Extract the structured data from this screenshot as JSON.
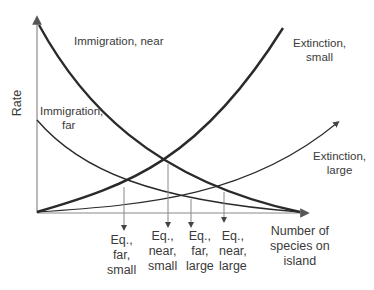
{
  "diagram": {
    "type": "island biogeography equilibrium model",
    "axes": {
      "y_label": "Rate",
      "x_label": "Number of species on island"
    },
    "curves": [
      {
        "name": "Immigration, near",
        "line1": "Immigration, near",
        "style": "thick"
      },
      {
        "name": "Immigration, far",
        "line1": "Immigration,",
        "line2": "far",
        "style": "thin"
      },
      {
        "name": "Extinction, small",
        "line1": "Extinction,",
        "line2": "small",
        "style": "thick"
      },
      {
        "name": "Extinction, large",
        "line1": "Extinction,",
        "line2": "large",
        "style": "thin"
      }
    ],
    "equilibria": [
      {
        "line1": "Eq.,",
        "line2": "far,",
        "line3": "small"
      },
      {
        "line1": "Eq.,",
        "line2": "near,",
        "line3": "small"
      },
      {
        "line1": "Eq.,",
        "line2": "far,",
        "line3": "large"
      },
      {
        "line1": "Eq.,",
        "line2": "near,",
        "line3": "large"
      }
    ],
    "x_axis_label_lines": [
      "Number of",
      "species on",
      "island"
    ],
    "colors": {
      "curve": "#2a2a2a",
      "axis": "#8a8a8a",
      "drop_line": "#888888"
    }
  }
}
